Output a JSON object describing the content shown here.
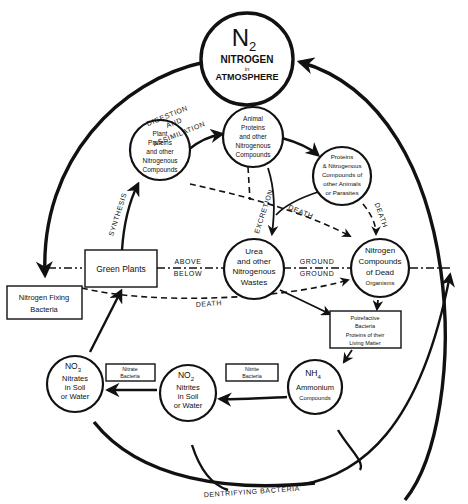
{
  "nodes": {
    "atmosphere": {
      "formula": "N",
      "sub": "2",
      "l1": "NITROGEN",
      "l2": "in",
      "l3": "ATMOSPHERE"
    },
    "plant_proteins": {
      "l1": "Plant",
      "l2": "Proteins",
      "l3": "and other",
      "l4": "Nitrogenous",
      "l5": "Compounds"
    },
    "animal_proteins": {
      "l1": "Animal",
      "l2": "Proteins",
      "l3": "and other",
      "l4": "Nitrogenous",
      "l5": "Compounds"
    },
    "parasite_proteins": {
      "l1": "Proteins",
      "l2": "& Nitrogenous",
      "l3": "Compounds of",
      "l4": "other Animals",
      "l5": "or Parasites"
    },
    "urea": {
      "l1": "Urea",
      "l2": "and other",
      "l3": "Nitrogenous",
      "l4": "Wastes"
    },
    "dead_organisms": {
      "l1": "Nitrogen",
      "l2": "Compounds",
      "l3": "of Dead",
      "l4": "Organisms"
    },
    "green_plants": {
      "label": "Green Plants"
    },
    "nitrogen_fixing": {
      "l1": "Nitrogen Fixing",
      "l2": "Bacteria"
    },
    "putrefactive": {
      "l1": "Putrefactive",
      "l2": "Bacteria",
      "l3": "Proteins of their",
      "l4": "Living Matter"
    },
    "ammonium": {
      "formula": "NH",
      "sub": "4",
      "l1": "Ammonium",
      "l2": "Compounds"
    },
    "nitrites": {
      "formula": "NO",
      "sub": "2",
      "l1": "Nitrites",
      "l2": "in Soil",
      "l3": "or Water"
    },
    "nitrates": {
      "formula": "NO",
      "sub": "3",
      "l1": "Nitrates",
      "l2": "in Soil",
      "l3": "or Water"
    },
    "nitrate_bacteria": {
      "l1": "Nitrate",
      "l2": "Bacteria"
    },
    "nitrite_bacteria": {
      "l1": "Nitrite",
      "l2": "Bacteria"
    }
  },
  "edge_labels": {
    "digestion": "DIGESTION",
    "and": "AND",
    "assimilation": "ASSIMILATION",
    "synthesis": "SYNTHESIS",
    "excretion": "EXCRETION",
    "death_1": "DEATH",
    "death_2": "DEATH",
    "death_3": "DEATH",
    "above": "ABOVE",
    "below": "BELOW",
    "ground_above": "GROUND",
    "ground_below": "GROUND",
    "dentrifying": "DENTRIFYING BACTERIA"
  },
  "colors": {
    "ink": "#111111",
    "background": "#ffffff"
  }
}
